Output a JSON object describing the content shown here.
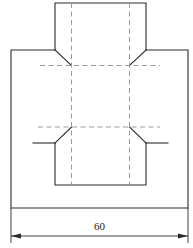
{
  "drawing": {
    "title": "Sheet metal bend flat-pattern technical drawing",
    "line_color": "#2b2b2b",
    "hidden_line_color": "#9a9a9a",
    "background_color": "#ffffff",
    "dimension": {
      "label": "60",
      "value": 60,
      "units": "",
      "orientation": "horizontal",
      "position": "bottom",
      "arrow_left": "arrow-left",
      "arrow_right": "arrow-right"
    },
    "views": [
      {
        "name": "flat-pattern-front-view"
      }
    ],
    "geometry": {
      "upper_flange": {
        "x1": 55,
        "y1": 3,
        "x2": 146,
        "y2": 50
      },
      "main_body": {
        "x1": 11,
        "y1": 50,
        "x2": 188,
        "y2": 208
      },
      "lower_flange": {
        "x1": 55,
        "y1": 143,
        "x2": 146,
        "y2": 185
      },
      "bend_line_upper_y": 65,
      "bend_line_lower_y": 127,
      "centerline_left_x": 71,
      "centerline_right_x": 130,
      "chamfer_top_left": [
        55,
        50,
        71,
        65
      ],
      "chamfer_top_right": [
        146,
        50,
        130,
        65
      ],
      "chamfer_bottom_left": [
        71,
        127,
        55,
        143
      ],
      "chamfer_bottom_right": [
        130,
        127,
        146,
        143
      ],
      "stub_left": [
        33,
        143,
        55,
        143
      ],
      "stub_right": [
        146,
        143,
        168,
        143
      ],
      "dimension_line_y": 236,
      "dimension_extent": [
        11,
        188
      ],
      "dimension_text_y": 226
    }
  }
}
